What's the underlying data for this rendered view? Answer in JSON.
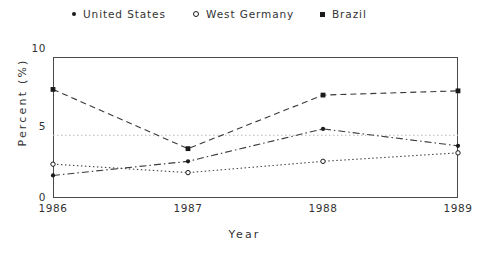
{
  "legend": {
    "entries": [
      {
        "label": "United States",
        "marker": "filled-dot-icon",
        "x": 72
      },
      {
        "label": "West Germany",
        "marker": "open-circle-icon",
        "x": 193
      },
      {
        "label": "Brazil",
        "marker": "filled-square-icon",
        "x": 320
      }
    ]
  },
  "chart_data": {
    "type": "line",
    "title": "",
    "xlabel": "Year",
    "ylabel": "Percent (%)",
    "categories": [
      "1986",
      "1987",
      "1988",
      "1989"
    ],
    "x": [
      1986,
      1987,
      1988,
      1989
    ],
    "xlim": [
      1986,
      1989
    ],
    "ylim": [
      0,
      10
    ],
    "yticks": [
      0,
      5,
      10
    ],
    "ytick_labels": [
      "0",
      "5",
      "10"
    ],
    "xtick_labels": [
      "1986",
      "1987",
      "1988",
      "1989"
    ],
    "grid": false,
    "legend_position": "above",
    "series": [
      {
        "name": "United States",
        "values": [
          1.6,
          2.6,
          4.9,
          3.7
        ],
        "marker": "filled-dot-icon",
        "linestyle": "dash-dot",
        "color": "#3a3a3a"
      },
      {
        "name": "West Germany",
        "values": [
          2.4,
          1.8,
          2.6,
          3.2
        ],
        "marker": "open-circle-icon",
        "linestyle": "dotted",
        "color": "#4a4a4a"
      },
      {
        "name": "Brazil",
        "values": [
          7.7,
          3.5,
          7.3,
          7.6
        ],
        "marker": "filled-square-icon",
        "linestyle": "dashed",
        "color": "#3a3a3a"
      }
    ],
    "reference_line": {
      "value": 4.45,
      "orientation": "horizontal",
      "linestyle": "dotted",
      "color": "#b8b8b8"
    }
  }
}
